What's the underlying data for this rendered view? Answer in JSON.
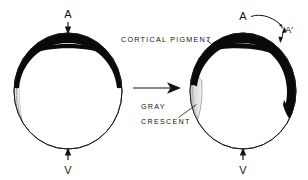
{
  "figure": {
    "kind": "embryology-diagram",
    "background_color": "#ffffff",
    "ink_color": "#141414",
    "pigment_color": "#0a0a0a",
    "crescent_color": "#d9d9d9"
  },
  "labels": {
    "cortical_pigment": "CORTICAL PIGMENT",
    "gray_crescent_line1": "GRAY",
    "gray_crescent_line2": "CRESCENT"
  },
  "left_cell": {
    "name": "unrotated-egg",
    "animal_pole_label": "A",
    "vegetal_pole_label": "V",
    "center_x": 68,
    "center_y": 91,
    "radius_x": 54,
    "radius_y": 58,
    "pigment_cap_description": "thick black cortical pigment band over the animal hemisphere, symmetric about the vertical axis",
    "crescent_description": "narrow faint stippled sliver on the left flank, barely visible"
  },
  "right_cell": {
    "name": "rotated-egg",
    "animal_pole_label": "A",
    "animal_pole_prime_label": "A′",
    "vegetal_pole_label": "V",
    "center_x": 243,
    "center_y": 91,
    "radius_x": 53,
    "radius_y": 58,
    "pigment_cap_description": "cortical pigment band rotated clockwise toward the right flank, exposing a pale region on the left",
    "crescent_description": "prominent pale gray crescent on the left flank where pigment withdrew"
  },
  "transition_arrow": {
    "name": "transition-arrow",
    "direction": "right",
    "from_x": 133,
    "to_x": 180,
    "y": 88
  },
  "rotation_arrow": {
    "name": "rotation-arrow",
    "description": "curved arrow from A sweeping clockwise to A-prime, indicating roughly 30 degrees of cortical rotation",
    "double_headed_marker": "small double-headed arrow marking the angular displacement"
  }
}
